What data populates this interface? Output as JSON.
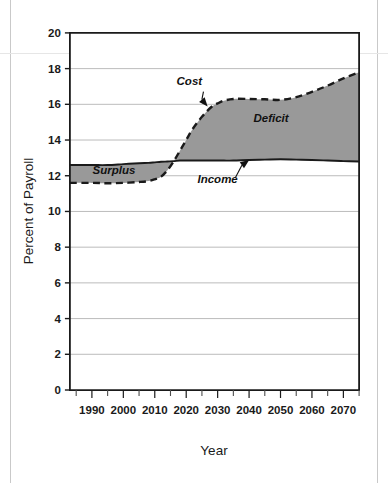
{
  "chart_data": {
    "type": "area",
    "title": "",
    "subtitle": "",
    "xlabel": "Year",
    "ylabel": "Percent of Payroll",
    "xlim": [
      1983,
      2075
    ],
    "ylim": [
      0,
      20
    ],
    "grid": true,
    "grid_axis": "y",
    "legend_position": "none",
    "y_ticks": [
      "0",
      "2",
      "4",
      "6",
      "8",
      "10",
      "12",
      "14",
      "16",
      "18",
      "20"
    ],
    "y_tick_values": [
      0,
      2,
      4,
      6,
      8,
      10,
      12,
      14,
      16,
      18,
      20
    ],
    "x_ticks": [
      "1990",
      "2000",
      "2010",
      "2020",
      "2030",
      "2040",
      "2050",
      "2060",
      "2070"
    ],
    "x_tick_values": [
      1990,
      2000,
      2010,
      2020,
      2030,
      2040,
      2050,
      2060,
      2070
    ],
    "x_minor_tick_interval": 5,
    "x": [
      1983,
      1990,
      1995,
      2000,
      2005,
      2008,
      2010,
      2012,
      2014,
      2016,
      2018,
      2020,
      2022,
      2025,
      2028,
      2030,
      2032,
      2035,
      2040,
      2045,
      2050,
      2055,
      2060,
      2065,
      2070,
      2075
    ],
    "series": [
      {
        "name": "Income",
        "style": "solid",
        "color": "#1a1a1a",
        "values": [
          12.6,
          12.6,
          12.6,
          12.65,
          12.7,
          12.72,
          12.75,
          12.78,
          12.8,
          12.82,
          12.85,
          12.85,
          12.85,
          12.85,
          12.85,
          12.85,
          12.85,
          12.85,
          12.88,
          12.9,
          12.92,
          12.9,
          12.88,
          12.85,
          12.82,
          12.8
        ]
      },
      {
        "name": "Cost",
        "style": "dashed",
        "color": "#1a1a1a",
        "values": [
          11.6,
          11.6,
          11.58,
          11.6,
          11.65,
          11.7,
          11.8,
          11.95,
          12.3,
          12.8,
          13.4,
          14.0,
          14.6,
          15.3,
          15.85,
          16.05,
          16.2,
          16.3,
          16.3,
          16.28,
          16.25,
          16.4,
          16.7,
          17.05,
          17.45,
          17.8
        ]
      }
    ],
    "fills": [
      {
        "name": "Surplus",
        "between": [
          "Cost",
          "Income"
        ],
        "color": "#999999",
        "x_range": [
          1983,
          2016
        ]
      },
      {
        "name": "Deficit",
        "between": [
          "Income",
          "Cost"
        ],
        "color": "#999999",
        "x_range": [
          2016,
          2075
        ]
      }
    ],
    "annotations": [
      {
        "name": "Surplus",
        "label": "Surplus",
        "x": 1997,
        "y": 12.1,
        "style": "bold-italic",
        "arrow": false
      },
      {
        "name": "Deficit",
        "label": "Deficit",
        "x": 2047,
        "y": 15.0,
        "style": "bold-italic",
        "arrow": false
      },
      {
        "name": "Cost",
        "label": "Cost",
        "x": 2021,
        "y": 17.1,
        "style": "bold-italic",
        "arrow": true,
        "arrow_to_x": 2026,
        "arrow_to_y": 16.05
      },
      {
        "name": "Income",
        "label": "Income",
        "x": 2030,
        "y": 11.6,
        "style": "bold-italic",
        "arrow": true,
        "arrow_to_x": 2039,
        "arrow_to_y": 12.75
      }
    ]
  }
}
